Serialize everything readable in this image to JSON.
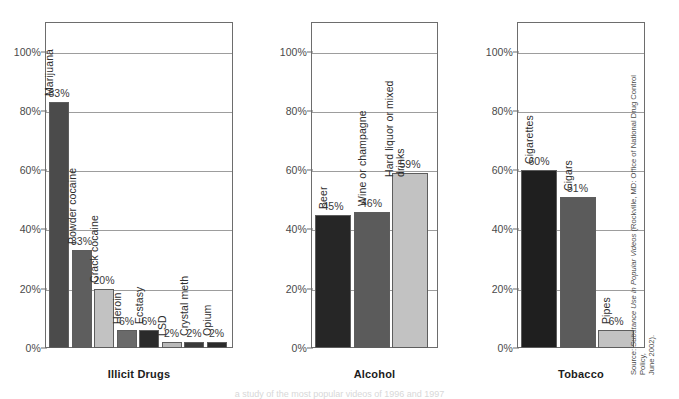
{
  "chart_data": {
    "type": "bar",
    "title": "",
    "xlabel": "",
    "ylabel": "",
    "ylim": [
      0,
      110
    ],
    "grid": true,
    "legend": "none",
    "axis_ticks": [
      "0%",
      "20%",
      "40%",
      "60%",
      "80%",
      "100%"
    ],
    "axis_tick_values": [
      0,
      20,
      40,
      60,
      80,
      100
    ],
    "panels": [
      {
        "title": "Illicit Drugs",
        "categories": [
          "Marijuana",
          "Powder cocaine",
          "Crack cocaine",
          "Heroin",
          "Ecstasy",
          "LSD",
          "Crystal meth",
          "Opium"
        ],
        "values": [
          83,
          33,
          20,
          6,
          6,
          2,
          2,
          2
        ],
        "labels": [
          "83%",
          "33%",
          "20%",
          "6%",
          "6%",
          "2%",
          "2%",
          "2%"
        ],
        "colors": [
          "#4b4b4b",
          "#5e5e5e",
          "#c2c2c2",
          "#6a6a6a",
          "#2b2b2b",
          "#b9b9b9",
          "#3a3a3a",
          "#2b2b2b"
        ]
      },
      {
        "title": "Alcohol",
        "categories": [
          "Beer",
          "Wine or champagne",
          "Hard liquor or mixed drinks"
        ],
        "values": [
          45,
          46,
          59
        ],
        "labels": [
          "45%",
          "46%",
          "59%"
        ],
        "colors": [
          "#262626",
          "#5b5b5b",
          "#c2c2c2"
        ]
      },
      {
        "title": "Tobacco",
        "categories": [
          "Cigarettes",
          "Cigars",
          "Pipes"
        ],
        "values": [
          60,
          51,
          6
        ],
        "labels": [
          "60%",
          "51%",
          "6%"
        ],
        "colors": [
          "#1f1f1f",
          "#5b5b5b",
          "#c2c2c2"
        ]
      }
    ]
  },
  "source_note": {
    "prefix": "Source: ",
    "italic_title": "Substance Use in Popular Videos",
    "suffix": " (Rockville, MD: Office of National Drug Control Policy,",
    "line2": "June 2002)."
  },
  "bottom_caption": {
    "text": "a study of the most popular videos of 1996 and 1997"
  },
  "colors": {
    "frame": "#6d6d6d",
    "gridline": "#9d9d9d",
    "text": "#2e2e2e"
  }
}
